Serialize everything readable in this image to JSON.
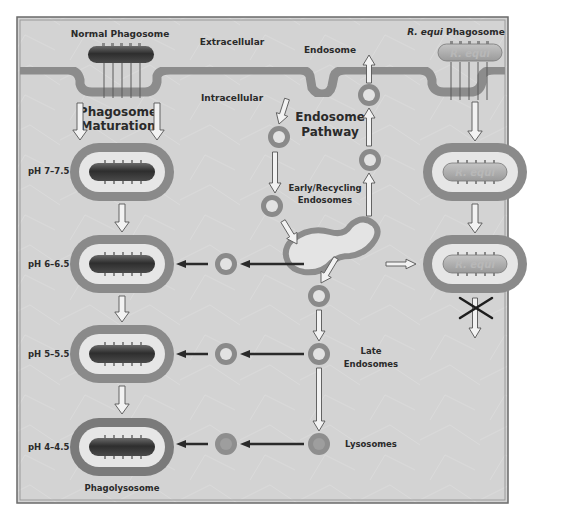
{
  "diagram": {
    "type": "cell-biology-pathway",
    "colors": {
      "background": "#d4d4d4",
      "frame": "#6a6a6a",
      "membrane": "#8c8c8c",
      "phagosome_ring": "#8a8a8a",
      "phagosome_inner": "#e6e6e6",
      "bacterium_dark": "#3a3a3a",
      "requi_body": "#a8a8a8",
      "arrow_fill": "#f2f2f2",
      "arrow_stroke": "#555555",
      "solid_arrow": "#2a2a2a"
    },
    "regions": {
      "extracellular": "Extracellular",
      "intracellular": "Intracellular"
    },
    "labels": {
      "normal_phagosome": "Normal Phagosome",
      "requi_phagosome_italic": "R. equi",
      "requi_phagosome_rest": " Phagosome",
      "endosome": "Endosome",
      "phagosome_maturation_line1": "Phagosome",
      "phagosome_maturation_line2": "Maturation",
      "endosome_pathway_line1": "Endosome",
      "endosome_pathway_line2": "Pathway",
      "early_recycling_line1": "Early/Recycling",
      "early_recycling_line2": "Endosomes",
      "late_endosomes_line1": "Late",
      "late_endosomes_line2": "Endosomes",
      "lysosomes": "Lysosomes",
      "phagolysosome": "Phagolysosome",
      "requi_body_text": "R. equi"
    },
    "ph_stages": [
      {
        "label": "pH 7–7.5"
      },
      {
        "label": "pH 6–6.5"
      },
      {
        "label": "pH 5–5.5"
      },
      {
        "label": "pH 4–4.5"
      }
    ],
    "blocked_step": "maturation blocked (X) after R. equi phagosome"
  }
}
